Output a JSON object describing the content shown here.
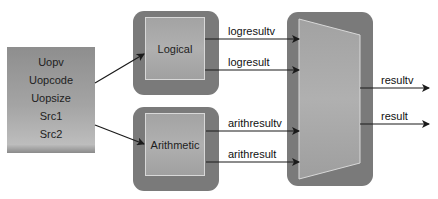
{
  "diagram": {
    "inputs": {
      "signals": [
        "Uopv",
        "Uopcode",
        "Uopsize",
        "Src1",
        "Src2"
      ]
    },
    "blocks": {
      "logical": {
        "label": "Logical"
      },
      "arithmetic": {
        "label": "Arithmetic"
      },
      "mux": {
        "label": ""
      }
    },
    "signals": {
      "logresultv": "logresultv",
      "logresult": "logresult",
      "arithresultv": "arithresultv",
      "arithresult": "arithresult",
      "resultv": "resultv",
      "result": "result"
    },
    "colors": {
      "block_outer": "#7a7a7a",
      "block_inner": "#aaaaaa",
      "inner_border": "#d8d8d8",
      "wire": "#1a1a1a"
    }
  }
}
